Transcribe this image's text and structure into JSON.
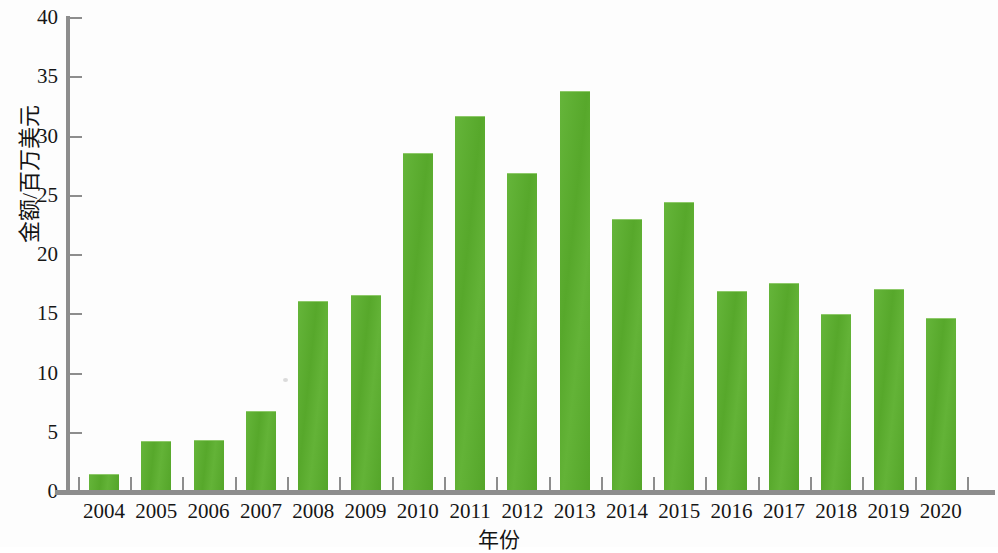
{
  "chart_data": {
    "type": "bar",
    "title": "",
    "xlabel": "年份",
    "ylabel": "金额/百万美元",
    "categories": [
      "2004",
      "2005",
      "2006",
      "2007",
      "2008",
      "2009",
      "2010",
      "2011",
      "2012",
      "2013",
      "2014",
      "2015",
      "2016",
      "2017",
      "2018",
      "2019",
      "2020"
    ],
    "values": [
      1.5,
      4.3,
      4.4,
      6.8,
      16.1,
      16.6,
      28.6,
      31.7,
      26.9,
      33.8,
      23.0,
      24.5,
      17.0,
      17.6,
      15.0,
      17.1,
      14.7
    ],
    "ylim": [
      0,
      40
    ],
    "ytick_labels": [
      "0",
      "5",
      "10",
      "15",
      "20",
      "25",
      "30",
      "35",
      "40"
    ],
    "ytick_values": [
      0,
      5,
      10,
      15,
      20,
      25,
      30,
      35,
      40
    ],
    "xlim_labels": [
      "2004",
      "2020"
    ],
    "grid": false,
    "legend": null,
    "series": [
      {
        "name": "金额",
        "values": [
          1.5,
          4.3,
          4.4,
          6.8,
          16.1,
          16.6,
          28.6,
          31.7,
          26.9,
          33.8,
          23.0,
          24.5,
          17.0,
          17.6,
          15.0,
          17.1,
          14.7
        ]
      }
    ],
    "colors": {
      "bar": "#5CAF2F",
      "bar_highlight": "#65B53A",
      "axis": "#8D8D8D",
      "text": "#161616",
      "background": "#FDFDFD"
    }
  }
}
